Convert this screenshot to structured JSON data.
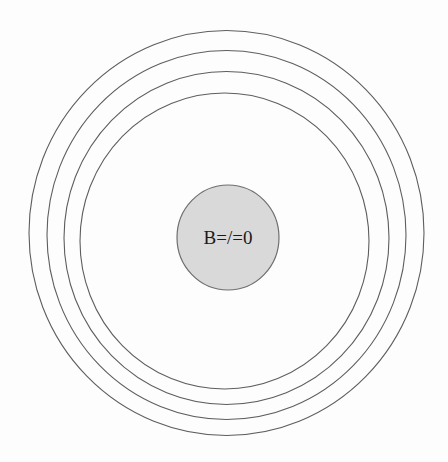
{
  "diagram": {
    "ring_count": 4,
    "core": {
      "label": "B=/=0",
      "fill_color": "#d9d9d9",
      "stroke_color": "#6e6e6e"
    },
    "ring_color": "#5e5e5e",
    "background_color": "#fdfdfd"
  }
}
